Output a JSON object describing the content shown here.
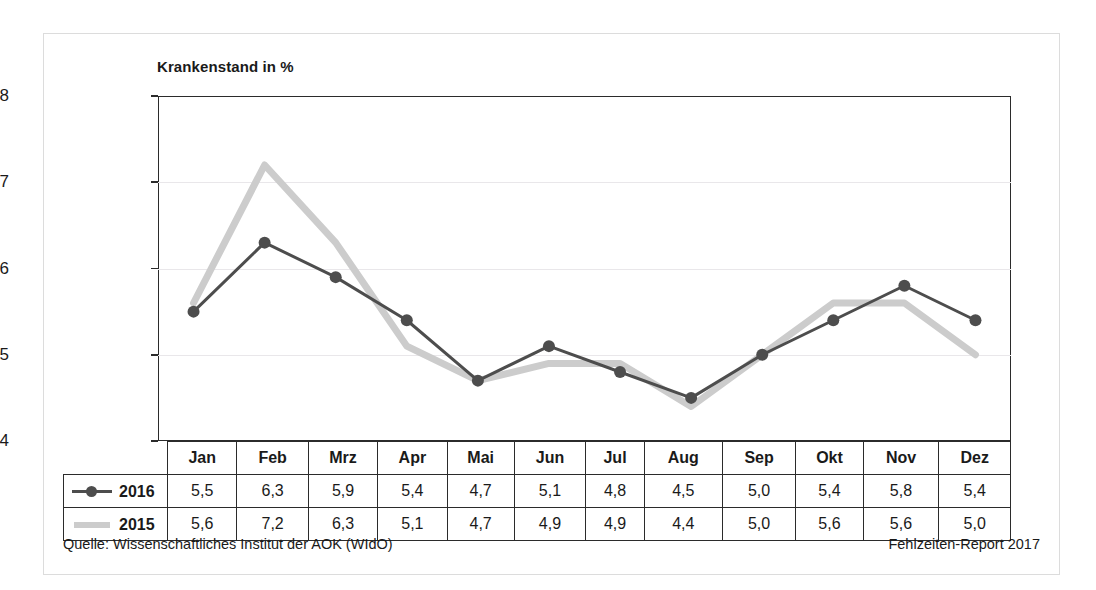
{
  "chart_data": {
    "type": "line",
    "title": "Krankenstand in %",
    "xlabel": "",
    "ylabel": "",
    "ylim": [
      4,
      8
    ],
    "yticks": [
      4,
      5,
      6,
      7,
      8
    ],
    "grid": true,
    "legend_position": "table-left",
    "categories": [
      "Jan",
      "Feb",
      "Mrz",
      "Apr",
      "Mai",
      "Jun",
      "Jul",
      "Aug",
      "Sep",
      "Okt",
      "Nov",
      "Dez"
    ],
    "series": [
      {
        "name": "2016",
        "color": "#4d4d4d",
        "marker": "circle",
        "values": [
          5.5,
          6.3,
          5.9,
          5.4,
          4.7,
          5.1,
          4.8,
          4.5,
          5.0,
          5.4,
          5.8,
          5.4
        ],
        "labels": [
          "5,5",
          "6,3",
          "5,9",
          "5,4",
          "4,7",
          "5,1",
          "4,8",
          "4,5",
          "5,0",
          "5,4",
          "5,8",
          "5,4"
        ]
      },
      {
        "name": "2015",
        "color": "#cccccc",
        "marker": "none",
        "values": [
          5.6,
          7.2,
          6.3,
          5.1,
          4.7,
          4.9,
          4.9,
          4.4,
          5.0,
          5.6,
          5.6,
          5.0
        ],
        "labels": [
          "5,6",
          "7,2",
          "6,3",
          "5,1",
          "4,7",
          "4,9",
          "4,9",
          "4,4",
          "5,0",
          "5,6",
          "5,6",
          "5,0"
        ]
      }
    ]
  },
  "table": {
    "corner_label": "",
    "header": [
      "Jan",
      "Feb",
      "Mrz",
      "Apr",
      "Mai",
      "Jun",
      "Jul",
      "Aug",
      "Sep",
      "Okt",
      "Nov",
      "Dez"
    ],
    "rows": [
      {
        "legend": "2016",
        "swatch": "line-with-circle-marker",
        "values": [
          "5,5",
          "6,3",
          "5,9",
          "5,4",
          "4,7",
          "5,1",
          "4,8",
          "4,5",
          "5,0",
          "5,4",
          "5,8",
          "5,4"
        ]
      },
      {
        "legend": "2015",
        "swatch": "thick-gray-line",
        "values": [
          "5,6",
          "7,2",
          "6,3",
          "5,1",
          "4,7",
          "4,9",
          "4,9",
          "4,4",
          "5,0",
          "5,6",
          "5,6",
          "5,0"
        ]
      }
    ]
  },
  "footer": {
    "source": "Quelle: Wissenschaftliches Institut der AOK (WIdO)",
    "report": "Fehlzeiten-Report 2017"
  },
  "colors": {
    "series_2016": "#4d4d4d",
    "series_2015": "#cccccc",
    "axis": "#2b2b2b",
    "grid": "#e9e7ea",
    "frame": "#dcdcdc"
  }
}
